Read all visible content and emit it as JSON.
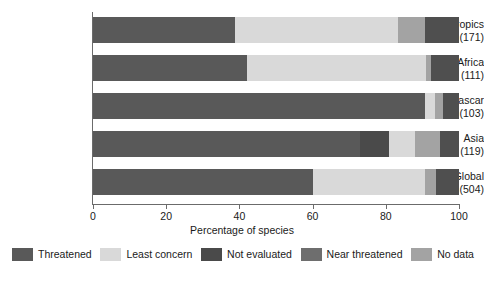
{
  "chart_data": {
    "type": "bar",
    "orientation": "horizontal",
    "stacked": true,
    "title": "",
    "xlabel": "Percentage of species",
    "ylabel": "",
    "xlim": [
      0,
      100
    ],
    "xticks": [
      0,
      20,
      40,
      60,
      80,
      100
    ],
    "xtick_labels": [
      "0",
      "20",
      "40",
      "60",
      "80",
      "100"
    ],
    "grid": false,
    "legend_position": "bottom",
    "categories": [
      "Neotropics",
      "Mainland Africa",
      "Madagascar",
      "Asia",
      "Global"
    ],
    "category_counts": [
      "(171)",
      "(111)",
      "(103)",
      "(119)",
      "(504)"
    ],
    "category_labels": [
      "Neotropics\n(171)",
      "Mainland Africa\n(111)",
      "Madagascar\n(103)",
      "Asia\n(119)",
      "Global\n(504)"
    ],
    "series": [
      {
        "name": "Threatened",
        "color": "#595959",
        "values": [
          38.8,
          42.0,
          90.7,
          73.0,
          60.0
        ]
      },
      {
        "name": "Least concern",
        "color": "#d9d9d9",
        "values": [
          44.5,
          49.0,
          2.7,
          0.0,
          30.7
        ]
      },
      {
        "name": "Not evaluated",
        "color": "#4a4a4a",
        "values": [
          0.0,
          0.0,
          0.0,
          8.0,
          0.0
        ]
      },
      {
        "name": "Near threatened",
        "color": "#6e6e6e",
        "values": [
          9.3,
          7.6,
          4.4,
          12.2,
          6.3
        ]
      },
      {
        "name": "No data",
        "color": "#a3a3a3",
        "values": [
          7.4,
          1.4,
          2.2,
          6.8,
          3.0
        ]
      }
    ],
    "stack_order": [
      "Threatened",
      "Least concern",
      "Not evaluated",
      "No data",
      "Near threatened"
    ],
    "bars": [
      {
        "category": "Neotropics",
        "count": "(171)",
        "segments": [
          {
            "label": "Threatened",
            "value": 38.8,
            "color": "#595959"
          },
          {
            "label": "Least concern",
            "value": 44.5,
            "color": "#d9d9d9"
          },
          {
            "label": "No data",
            "value": 7.4,
            "color": "#a3a3a3"
          },
          {
            "label": "Near threatened",
            "value": 9.3,
            "color": "#4f4f4f"
          }
        ]
      },
      {
        "category": "Mainland Africa",
        "count": "(111)",
        "segments": [
          {
            "label": "Threatened",
            "value": 42.0,
            "color": "#595959"
          },
          {
            "label": "Least concern",
            "value": 49.0,
            "color": "#d9d9d9"
          },
          {
            "label": "No data",
            "value": 1.4,
            "color": "#a3a3a3"
          },
          {
            "label": "Near threatened",
            "value": 7.6,
            "color": "#4f4f4f"
          }
        ]
      },
      {
        "category": "Madagascar",
        "count": "(103)",
        "segments": [
          {
            "label": "Threatened",
            "value": 90.7,
            "color": "#595959"
          },
          {
            "label": "Least concern",
            "value": 2.7,
            "color": "#d9d9d9"
          },
          {
            "label": "No data",
            "value": 2.2,
            "color": "#a3a3a3"
          },
          {
            "label": "Near threatened",
            "value": 4.4,
            "color": "#4f4f4f"
          }
        ]
      },
      {
        "category": "Asia",
        "count": "(119)",
        "segments": [
          {
            "label": "Threatened",
            "value": 73.0,
            "color": "#595959"
          },
          {
            "label": "Not evaluated",
            "value": 8.0,
            "color": "#4a4a4a"
          },
          {
            "label": "Least concern",
            "value": 7.1,
            "color": "#d9d9d9"
          },
          {
            "label": "No data",
            "value": 6.8,
            "color": "#a3a3a3"
          },
          {
            "label": "Near threatened",
            "value": 5.1,
            "color": "#4f4f4f"
          }
        ]
      },
      {
        "category": "Global",
        "count": "(504)",
        "segments": [
          {
            "label": "Threatened",
            "value": 60.0,
            "color": "#595959"
          },
          {
            "label": "Least concern",
            "value": 30.7,
            "color": "#d9d9d9"
          },
          {
            "label": "No data",
            "value": 3.0,
            "color": "#a3a3a3"
          },
          {
            "label": "Near threatened",
            "value": 6.3,
            "color": "#4f4f4f"
          }
        ]
      }
    ]
  },
  "axis": {
    "x_title": "Percentage of species",
    "ticks": [
      "0",
      "20",
      "40",
      "60",
      "80",
      "100"
    ]
  },
  "legend": {
    "items": [
      {
        "label": "Threatened",
        "color": "#595959"
      },
      {
        "label": "Least concern",
        "color": "#d9d9d9"
      },
      {
        "label": "Not evaluated",
        "color": "#4a4a4a"
      },
      {
        "label": "Near threatened",
        "color": "#6e6e6e"
      },
      {
        "label": "No data",
        "color": "#a3a3a3"
      }
    ]
  }
}
